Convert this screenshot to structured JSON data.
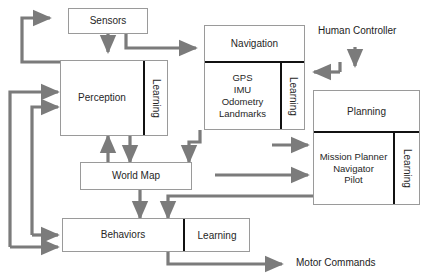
{
  "diagram": {
    "colors": {
      "arrow": "#7b7b7b",
      "box_border": "#9a9a9a",
      "divider": "#111111",
      "text": "#262626",
      "background": "#ffffff"
    },
    "nodes": {
      "sensors": {
        "label": "Sensors"
      },
      "perception": {
        "label": "Perception",
        "learning_label": "Learning"
      },
      "navigation": {
        "label": "Navigation",
        "items": [
          "GPS",
          "IMU",
          "Odometry",
          "Landmarks"
        ],
        "learning_label": "Learning"
      },
      "planning": {
        "label": "Planning",
        "items": [
          "Mission Planner",
          "Navigator",
          "Pilot"
        ],
        "learning_label": "Learning"
      },
      "world_map": {
        "label": "World Map"
      },
      "behaviors": {
        "label": "Behaviors",
        "learning_label": "Learning"
      }
    },
    "labels": {
      "human_controller": "Human Controller",
      "motor_commands": "Motor Commands"
    }
  }
}
